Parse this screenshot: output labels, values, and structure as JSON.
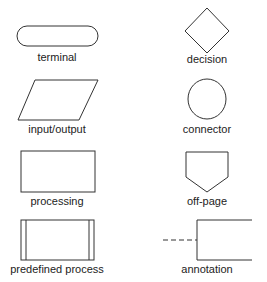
{
  "diagram": {
    "symbols": [
      {
        "shape": "terminal",
        "label": "terminal"
      },
      {
        "shape": "decision",
        "label": "decision"
      },
      {
        "shape": "input-output",
        "label": "input/output"
      },
      {
        "shape": "connector",
        "label": "connector"
      },
      {
        "shape": "processing",
        "label": "processing"
      },
      {
        "shape": "off-page",
        "label": "off-page"
      },
      {
        "shape": "predefined-process",
        "label": "predefined process"
      },
      {
        "shape": "annotation",
        "label": "annotation"
      }
    ],
    "stroke_color": "#333333"
  }
}
